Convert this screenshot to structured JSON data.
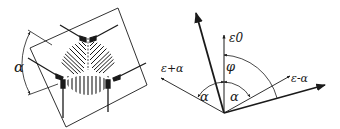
{
  "figure": {
    "left_panel": {
      "description": "strain gauge rosette (three-element, delta/120° arrangement) on rotated square carrier",
      "angle_label": "α"
    },
    "right_panel": {
      "description": "strain direction vector diagram",
      "labels": {
        "eps_plus_alpha": "ε+α",
        "eps_zero": "ε0",
        "eps_minus_alpha": "ε-α",
        "phi": "φ",
        "alpha_left": "α",
        "alpha_right": "α"
      }
    },
    "colors": {
      "ink": "#1a1a1a",
      "background": "#ffffff"
    }
  }
}
